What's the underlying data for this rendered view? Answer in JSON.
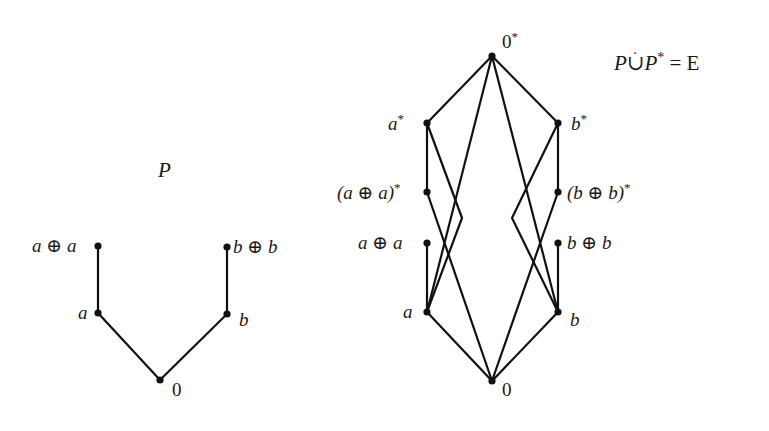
{
  "left_poset": {
    "title": "P",
    "nodes": [
      {
        "id": "aa",
        "label": "a ⊕ a",
        "x": 98,
        "y": 246
      },
      {
        "id": "a",
        "label": "a",
        "x": 98,
        "y": 313
      },
      {
        "id": "zero",
        "label": "0",
        "x": 160,
        "y": 380
      },
      {
        "id": "b",
        "label": "b",
        "x": 227,
        "y": 314
      },
      {
        "id": "bb",
        "label": "b ⊕ b",
        "x": 227,
        "y": 247
      }
    ],
    "edges": [
      [
        "aa",
        "a"
      ],
      [
        "a",
        "zero"
      ],
      [
        "zero",
        "b"
      ],
      [
        "b",
        "bb"
      ]
    ]
  },
  "right_poset": {
    "title": "P∪̇P* = E",
    "nodes": [
      {
        "id": "top",
        "label": "0*",
        "x": 492,
        "y": 56
      },
      {
        "id": "as",
        "label": "a*",
        "x": 427,
        "y": 123
      },
      {
        "id": "bs",
        "label": "b*",
        "x": 558,
        "y": 123
      },
      {
        "id": "aas",
        "label": "(a ⊕ a)*",
        "x": 427,
        "y": 192
      },
      {
        "id": "bbs",
        "label": "(b ⊕ b)*",
        "x": 558,
        "y": 192
      },
      {
        "id": "aa",
        "label": "a ⊕ a",
        "x": 427,
        "y": 243
      },
      {
        "id": "bb",
        "label": "b ⊕ b",
        "x": 558,
        "y": 243
      },
      {
        "id": "a",
        "label": "a",
        "x": 427,
        "y": 312
      },
      {
        "id": "b",
        "label": "b",
        "x": 558,
        "y": 312
      },
      {
        "id": "zero",
        "label": "0",
        "x": 492,
        "y": 381
      }
    ],
    "edges": [
      [
        "top",
        "as"
      ],
      [
        "top",
        "bs"
      ],
      [
        "top",
        "a"
      ],
      [
        "top",
        "b"
      ],
      [
        "as",
        "aas"
      ],
      [
        "as",
        "a"
      ],
      [
        "aas",
        "zero"
      ],
      [
        "aa",
        "a"
      ],
      [
        "a",
        "zero"
      ],
      [
        "bs",
        "bbs"
      ],
      [
        "bs",
        "b"
      ],
      [
        "bbs",
        "zero"
      ],
      [
        "bb",
        "b"
      ],
      [
        "b",
        "zero"
      ]
    ]
  },
  "labels": {
    "P": "P",
    "aa": "a ⊕ a",
    "a": "a",
    "zero": "0",
    "b": "b",
    "bb": "b ⊕ b",
    "top_base": "0",
    "star": "*",
    "as_base": "a",
    "bs_base": "b",
    "aas_base": "(a ⊕ a)",
    "bbs_base": "(b ⊕ b)",
    "eq_P1": "P",
    "eq_cup": "∪",
    "eq_P2": "P",
    "eq_rest": "= E"
  }
}
